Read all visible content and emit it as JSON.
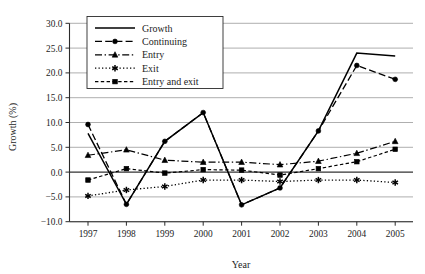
{
  "chart_data": {
    "type": "line",
    "title": "",
    "xlabel": "Year",
    "ylabel": "Growth (%)",
    "categories": [
      "1997",
      "1998",
      "1999",
      "2000",
      "2001",
      "2002",
      "2003",
      "2004",
      "2005"
    ],
    "x": [
      1997,
      1998,
      1999,
      2000,
      2001,
      2002,
      2003,
      2004,
      2005
    ],
    "ylim": [
      -10.0,
      30.0
    ],
    "yticks": [
      -10.0,
      -5.0,
      0.0,
      5.0,
      10.0,
      15.0,
      20.0,
      25.0,
      30.0
    ],
    "ytick_labels": [
      "−10.0",
      "−5.0",
      "0.0",
      "5.0",
      "10.0",
      "15.0",
      "20.0",
      "25.0",
      "30.0"
    ],
    "grid": true,
    "grid_axis": "y",
    "legend_position": "upper-left-inside",
    "series": [
      {
        "name": "Growth",
        "values": [
          7.8,
          -6.5,
          6.2,
          12.0,
          -6.6,
          -3.2,
          8.3,
          24.0,
          23.4
        ],
        "marker": "none",
        "dash": "solid",
        "color": "#000000"
      },
      {
        "name": "Continuing",
        "values": [
          9.6,
          -6.5,
          6.2,
          12.0,
          -6.6,
          -3.2,
          8.3,
          21.5,
          18.7
        ],
        "marker": "circle",
        "dash": "dashed",
        "color": "#000000"
      },
      {
        "name": "Entry",
        "values": [
          3.4,
          4.5,
          2.4,
          2.0,
          2.0,
          1.5,
          2.2,
          3.8,
          6.2
        ],
        "marker": "triangle",
        "dash": "dash-dot",
        "color": "#000000"
      },
      {
        "name": "Exit",
        "values": [
          -4.8,
          -3.6,
          -2.9,
          -1.6,
          -1.6,
          -1.9,
          -1.6,
          -1.6,
          -2.1
        ],
        "marker": "star",
        "dash": "dotted",
        "color": "#000000"
      },
      {
        "name": "Entry and exit",
        "values": [
          -1.6,
          0.7,
          -0.2,
          0.5,
          0.4,
          -0.6,
          0.7,
          2.1,
          4.6
        ],
        "marker": "square",
        "dash": "dashed-short",
        "color": "#000000"
      }
    ]
  },
  "axes": {
    "y_title": "Growth (%)",
    "x_title": "Year",
    "y_tick_0": "30.0",
    "y_tick_1": "25.0",
    "y_tick_2": "20.0",
    "y_tick_3": "15.0",
    "y_tick_4": "10.0",
    "y_tick_5": "5.0",
    "y_tick_6": "0.0",
    "y_tick_7": "−5.0",
    "y_tick_8": "−10.0",
    "x_tick_0": "1997",
    "x_tick_1": "1998",
    "x_tick_2": "1999",
    "x_tick_3": "2000",
    "x_tick_4": "2001",
    "x_tick_5": "2002",
    "x_tick_6": "2003",
    "x_tick_7": "2004",
    "x_tick_8": "2005"
  },
  "legend": {
    "entry_0": "Growth",
    "entry_1": "Continuing",
    "entry_2": "Entry",
    "entry_3": "Exit",
    "entry_4": "Entry and exit"
  },
  "colors": {
    "ink": "#000000",
    "grid": "#9a9a9a",
    "background": "#ffffff"
  }
}
